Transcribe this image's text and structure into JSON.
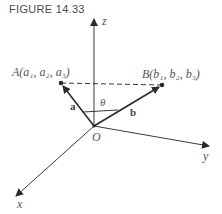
{
  "figure": {
    "caption": "FIGURE 14.33"
  },
  "axes": {
    "x_label": "x",
    "y_label": "y",
    "z_label": "z",
    "origin_label": "O"
  },
  "points": {
    "A_label": "A(a₁, a₂, a₃)",
    "B_label": "B(b₁, b₂, b₃)"
  },
  "vectors": {
    "a_label": "a",
    "b_label": "b"
  },
  "angle": {
    "label": "θ"
  },
  "colors": {
    "line": "#3a3a3a",
    "text": "#555555"
  }
}
